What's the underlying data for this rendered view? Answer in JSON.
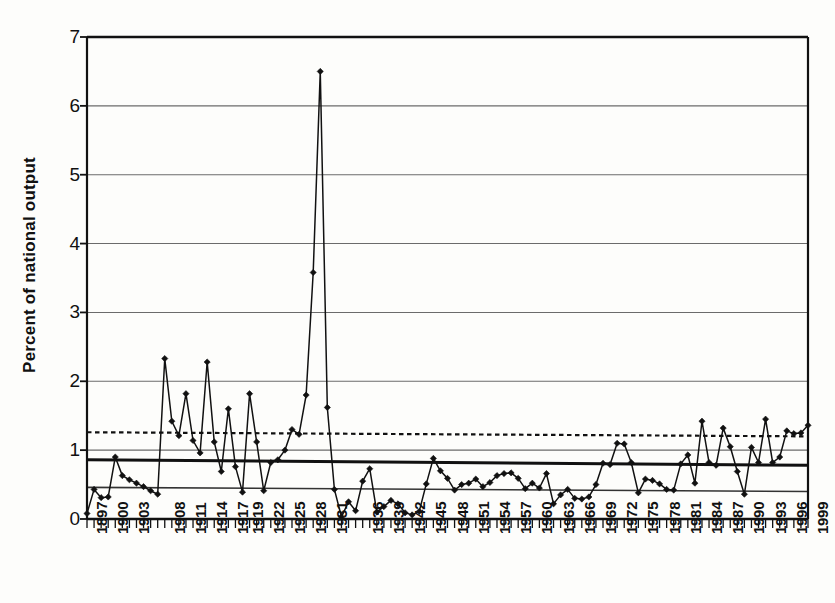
{
  "chart_data": {
    "type": "line",
    "title": "",
    "xlabel": "",
    "ylabel": "Percent of national output",
    "ylim": [
      0,
      7
    ],
    "xlim": [
      1897,
      1999
    ],
    "grid": true,
    "legend": "none",
    "y_tick_labels": [
      "0",
      "1",
      "2",
      "3",
      "4",
      "5",
      "6",
      "7"
    ],
    "y_ticks": [
      0,
      1,
      2,
      3,
      4,
      5,
      6,
      7
    ],
    "x_tick_labels": [
      "1897",
      "1900",
      "1903",
      "1908",
      "1911",
      "1914",
      "1917",
      "1919",
      "1922",
      "1925",
      "1928",
      "1931",
      "1936",
      "1939",
      "1942",
      "1945",
      "1948",
      "1951",
      "1954",
      "1957",
      "1960",
      "1963",
      "1966",
      "1969",
      "1972",
      "1975",
      "1978",
      "1981",
      "1984",
      "1987",
      "1990",
      "1993",
      "1996",
      "1999"
    ],
    "x_tick_label_years": [
      1897,
      1900,
      1903,
      1908,
      1911,
      1914,
      1917,
      1919,
      1922,
      1925,
      1928,
      1931,
      1936,
      1939,
      1942,
      1945,
      1948,
      1951,
      1954,
      1957,
      1960,
      1963,
      1966,
      1969,
      1972,
      1975,
      1978,
      1981,
      1984,
      1987,
      1990,
      1993,
      1996,
      1999
    ],
    "marker": "diamond",
    "series": [
      {
        "name": "Percent of national output",
        "x": [
          1897,
          1898,
          1899,
          1900,
          1901,
          1902,
          1903,
          1904,
          1905,
          1906,
          1907,
          1908,
          1909,
          1910,
          1911,
          1912,
          1913,
          1914,
          1915,
          1916,
          1917,
          1918,
          1919,
          1920,
          1921,
          1922,
          1923,
          1924,
          1925,
          1926,
          1927,
          1928,
          1929,
          1930,
          1931,
          1932,
          1933,
          1934,
          1935,
          1936,
          1937,
          1938,
          1939,
          1940,
          1941,
          1942,
          1943,
          1944,
          1945,
          1946,
          1947,
          1948,
          1949,
          1950,
          1951,
          1952,
          1953,
          1954,
          1955,
          1956,
          1957,
          1958,
          1959,
          1960,
          1961,
          1962,
          1963,
          1964,
          1965,
          1966,
          1967,
          1968,
          1969,
          1970,
          1971,
          1972,
          1973,
          1974,
          1975,
          1976,
          1977,
          1978,
          1979,
          1980,
          1981,
          1982,
          1983,
          1984,
          1985,
          1986,
          1987,
          1988,
          1989,
          1990,
          1991,
          1992,
          1993,
          1994,
          1995,
          1996,
          1997,
          1998,
          1999
        ],
        "y": [
          0.08,
          0.43,
          0.31,
          0.32,
          0.9,
          0.63,
          0.57,
          0.52,
          0.47,
          0.41,
          0.36,
          2.33,
          1.42,
          1.21,
          1.82,
          1.14,
          0.96,
          2.28,
          1.12,
          0.69,
          1.6,
          0.76,
          0.39,
          1.82,
          1.12,
          0.41,
          0.82,
          0.86,
          1.0,
          1.3,
          1.23,
          1.8,
          3.58,
          6.5,
          1.62,
          0.43,
          0.03,
          0.25,
          0.12,
          0.55,
          0.73,
          0.1,
          0.18,
          0.27,
          0.22,
          0.09,
          0.06,
          0.11,
          0.51,
          0.88,
          0.7,
          0.59,
          0.42,
          0.5,
          0.52,
          0.58,
          0.47,
          0.53,
          0.63,
          0.66,
          0.67,
          0.59,
          0.44,
          0.52,
          0.45,
          0.66,
          0.22,
          0.35,
          0.43,
          0.3,
          0.29,
          0.32,
          0.5,
          0.81,
          0.79,
          1.1,
          1.09,
          0.82,
          0.38,
          0.58,
          0.56,
          0.51,
          0.43,
          0.42,
          0.8,
          0.93,
          0.52,
          1.42,
          0.82,
          0.78,
          1.32,
          1.05,
          0.69,
          0.36,
          1.04,
          0.82,
          1.45,
          0.82,
          0.9,
          1.28,
          1.24,
          1.25,
          1.36
        ]
      }
    ],
    "reference_lines": [
      {
        "name": "dotted-average-line",
        "style": "dotted",
        "y_start": 1.26,
        "y_end": 1.2,
        "width": 2.2,
        "color": "#111111"
      },
      {
        "name": "thick-mean-line",
        "style": "solid-thick",
        "y_start": 0.86,
        "y_end": 0.78,
        "width": 3.0,
        "color": "#111111"
      },
      {
        "name": "thin-lower-line",
        "style": "solid-thin",
        "y_start": 0.46,
        "y_end": 0.4,
        "width": 1.6,
        "color": "#333333"
      }
    ]
  },
  "axes": {
    "y_axis_title": "Percent of national output"
  }
}
